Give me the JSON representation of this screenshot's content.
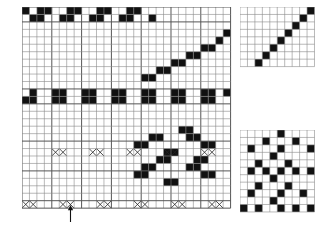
{
  "figure": {
    "kind": "weaving-draft",
    "title": "",
    "background": "#ffffff",
    "ink": "#111111",
    "gridline": "#8a8a8a",
    "gridline_strong": "#555555"
  },
  "geometry": {
    "cell": 7.45,
    "threading": {
      "x": 22,
      "y": 7,
      "cols": 28,
      "rows": 2
    },
    "main": {
      "x": 22,
      "y": 7,
      "cols": 28,
      "rows": 27
    },
    "tieup": {
      "x": 240,
      "y": 7,
      "cols": 10,
      "rows": 8
    },
    "treadling": {
      "x": 240,
      "y": 130,
      "cols": 10,
      "rows": 13
    }
  },
  "panels": {
    "draft": {
      "name": "drawdown-and-threading",
      "cols": 28,
      "rows": 27,
      "x": 22,
      "y": 7,
      "cellw": 7.45,
      "cellh": 7.45,
      "heavy_cols": [
        0,
        4,
        8,
        12,
        16,
        20,
        24,
        28
      ],
      "heavy_rows": [
        0,
        2,
        11,
        13,
        18,
        22,
        26,
        27
      ],
      "filled": [
        [
          0,
          0
        ],
        [
          2,
          0
        ],
        [
          3,
          0
        ],
        [
          6,
          0
        ],
        [
          7,
          0
        ],
        [
          10,
          0
        ],
        [
          11,
          0
        ],
        [
          14,
          0
        ],
        [
          15,
          0
        ],
        [
          1,
          1
        ],
        [
          2,
          1
        ],
        [
          5,
          1
        ],
        [
          6,
          1
        ],
        [
          9,
          1
        ],
        [
          10,
          1
        ],
        [
          13,
          1
        ],
        [
          14,
          1
        ],
        [
          17,
          1
        ],
        [
          27,
          3
        ],
        [
          26,
          4
        ],
        [
          25,
          5
        ],
        [
          24,
          5
        ],
        [
          23,
          6
        ],
        [
          22,
          6
        ],
        [
          21,
          7
        ],
        [
          20,
          7
        ],
        [
          19,
          8
        ],
        [
          18,
          8
        ],
        [
          17,
          9
        ],
        [
          16,
          9
        ],
        [
          1,
          11
        ],
        [
          4,
          11
        ],
        [
          5,
          11
        ],
        [
          8,
          11
        ],
        [
          9,
          11
        ],
        [
          12,
          11
        ],
        [
          13,
          11
        ],
        [
          16,
          11
        ],
        [
          17,
          11
        ],
        [
          20,
          11
        ],
        [
          21,
          11
        ],
        [
          24,
          11
        ],
        [
          25,
          11
        ],
        [
          27,
          11
        ],
        [
          0,
          12
        ],
        [
          1,
          12
        ],
        [
          4,
          12
        ],
        [
          5,
          12
        ],
        [
          8,
          12
        ],
        [
          9,
          12
        ],
        [
          12,
          12
        ],
        [
          13,
          12
        ],
        [
          16,
          12
        ],
        [
          17,
          12
        ],
        [
          20,
          12
        ],
        [
          21,
          12
        ],
        [
          24,
          12
        ],
        [
          25,
          12
        ],
        [
          21,
          16
        ],
        [
          22,
          16
        ],
        [
          17,
          17
        ],
        [
          18,
          17
        ],
        [
          22,
          17
        ],
        [
          23,
          17
        ],
        [
          15,
          18
        ],
        [
          16,
          18
        ],
        [
          24,
          18
        ],
        [
          25,
          18
        ],
        [
          19,
          19
        ],
        [
          20,
          19
        ],
        [
          18,
          20
        ],
        [
          19,
          20
        ],
        [
          23,
          20
        ],
        [
          24,
          20
        ],
        [
          16,
          21
        ],
        [
          17,
          21
        ],
        [
          22,
          21
        ],
        [
          23,
          21
        ],
        [
          15,
          22
        ],
        [
          16,
          22
        ],
        [
          24,
          22
        ],
        [
          25,
          22
        ],
        [
          19,
          23
        ],
        [
          20,
          23
        ]
      ],
      "x_marks_span2": [
        {
          "row": 19,
          "col": 4
        },
        {
          "row": 19,
          "col": 9
        },
        {
          "row": 19,
          "col": 14
        },
        {
          "row": 19,
          "col": 19
        },
        {
          "row": 19,
          "col": 24
        },
        {
          "row": 26,
          "col": 0
        },
        {
          "row": 26,
          "col": 5
        },
        {
          "row": 26,
          "col": 10
        },
        {
          "row": 26,
          "col": 15
        },
        {
          "row": 26,
          "col": 20
        },
        {
          "row": 26,
          "col": 25
        }
      ]
    },
    "tieup": {
      "name": "tie-up-diagonal",
      "cols": 10,
      "rows": 8,
      "x": 240,
      "y": 7,
      "cellw": 7.45,
      "cellh": 7.45,
      "filled": [
        [
          9,
          0
        ],
        [
          8,
          1
        ],
        [
          7,
          2
        ],
        [
          6,
          3
        ],
        [
          5,
          4
        ],
        [
          4,
          5
        ],
        [
          3,
          6
        ],
        [
          2,
          7
        ]
      ]
    },
    "treadling": {
      "name": "treadling-sequence",
      "cols": 10,
      "rows": 11,
      "x": 240,
      "y": 130,
      "cellw": 7.45,
      "cellh": 7.45,
      "filled": [
        [
          5,
          0
        ],
        [
          3,
          1
        ],
        [
          7,
          1
        ],
        [
          1,
          2
        ],
        [
          5,
          2
        ],
        [
          9,
          2
        ],
        [
          4,
          3
        ],
        [
          2,
          4
        ],
        [
          6,
          4
        ],
        [
          1,
          5
        ],
        [
          3,
          5
        ],
        [
          5,
          5
        ],
        [
          7,
          5
        ],
        [
          9,
          5
        ],
        [
          4,
          6
        ],
        [
          2,
          7
        ],
        [
          6,
          7
        ],
        [
          1,
          8
        ],
        [
          5,
          8
        ],
        [
          8,
          8
        ],
        [
          4,
          9
        ],
        [
          0,
          10
        ],
        [
          2,
          10
        ],
        [
          5,
          10
        ],
        [
          7,
          10
        ],
        [
          9,
          10
        ]
      ]
    }
  },
  "annotations": {
    "arrow": {
      "name": "repeat-start-arrow",
      "x": 70,
      "y": 205,
      "height": 17,
      "direction": "up"
    }
  },
  "labels": {
    "threading_caption": "",
    "tieup_caption": "",
    "treadling_caption": ""
  }
}
